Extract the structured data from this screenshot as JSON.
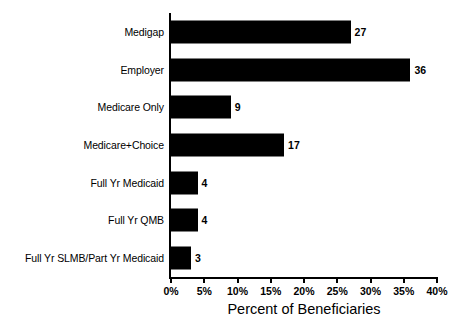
{
  "chart_data": {
    "type": "bar",
    "orientation": "horizontal",
    "title": "",
    "xlabel": "Percent of Beneficiaries",
    "ylabel": "",
    "categories": [
      "Medigap",
      "Employer",
      "Medicare Only",
      "Medicare+Choice",
      "Full Yr Medicaid",
      "Full Yr QMB",
      "Full Yr SLMB/Part Yr Medicaid"
    ],
    "values": [
      27,
      36,
      9,
      17,
      4,
      4,
      3
    ],
    "value_labels": [
      "27",
      "36",
      "9",
      "17",
      "4",
      "4",
      "3"
    ],
    "xlim": [
      0,
      40
    ],
    "xticks": [
      0,
      5,
      10,
      15,
      20,
      25,
      30,
      35,
      40
    ],
    "xtick_labels": [
      "0%",
      "5%",
      "10%",
      "15%",
      "20%",
      "25%",
      "30%",
      "35%",
      "40%"
    ],
    "grid": false,
    "legend": false,
    "bar_color": "#000000",
    "background_color": "#ffffff",
    "axis_color": "#000000"
  }
}
